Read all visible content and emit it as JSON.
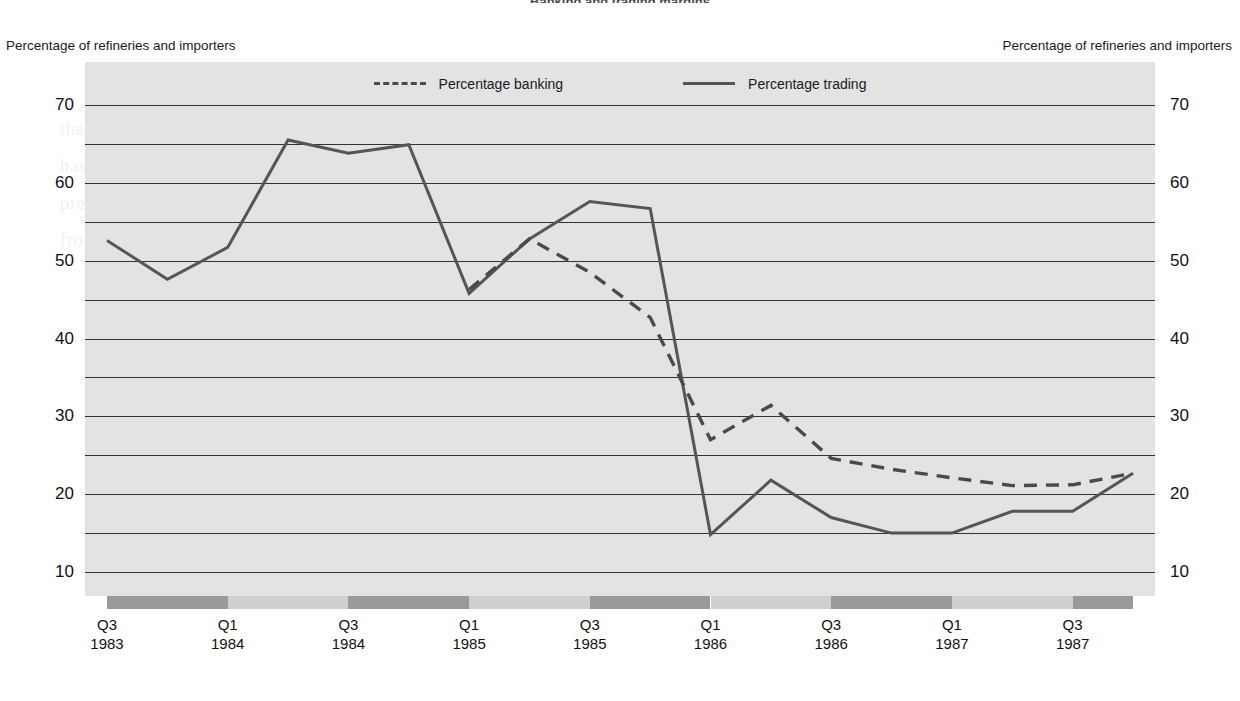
{
  "title_partial": "Banking and trading margins",
  "axis_caption_left": "Percentage of refineries and importers",
  "axis_caption_right": "Percentage of refineries and importers",
  "colors": {
    "plot_background": "#e3e3e3",
    "gridline": "#333333",
    "trading_line": "#555555",
    "banking_line": "#4a4a4a",
    "band_dark": "#9a9a9a",
    "band_light": "#cfcfcf"
  },
  "legend": {
    "position": "top-center",
    "items": [
      {
        "label": "Percentage banking",
        "style": "dashed",
        "name": "legend-banking"
      },
      {
        "label": "Percentage trading",
        "style": "solid",
        "name": "legend-trading"
      }
    ]
  },
  "yticks": [
    "70",
    "60",
    "50",
    "40",
    "30",
    "20",
    "10"
  ],
  "xlabels": [
    {
      "q": "Q3",
      "year": "1983"
    },
    {
      "q": "Q1",
      "year": "1984"
    },
    {
      "q": "Q3",
      "year": "1984"
    },
    {
      "q": "Q1",
      "year": "1985"
    },
    {
      "q": "Q3",
      "year": "1985"
    },
    {
      "q": "Q1",
      "year": "1986"
    },
    {
      "q": "Q3",
      "year": "1986"
    },
    {
      "q": "Q1",
      "year": "1987"
    },
    {
      "q": "Q3",
      "year": "1987"
    }
  ],
  "bleed_text": "the market which had been the scene of so much activity in the preceding period. It is clear that the number of participants in the market has declined sharply since the middle of 1985, and that the remaining traders account for a much larger share of total turnover than was previously the case. The figures below show this trend, with the proportion of refineries and importers reporting trading activity falling from about sixty-five per cent to under twenty per cent over a period of some eighteen months.",
  "chart_data": {
    "type": "line",
    "title": "Banking and trading margins",
    "xlabel": "",
    "ylabel": "Percentage of refineries and importers",
    "ylim": [
      10,
      70
    ],
    "yticks": [
      10,
      15,
      20,
      25,
      30,
      35,
      40,
      45,
      50,
      55,
      60,
      65,
      70
    ],
    "ytick_labels_shown": [
      10,
      20,
      30,
      40,
      50,
      60,
      70
    ],
    "grid": true,
    "grid_interval": 5,
    "legend_position": "top-center",
    "x": [
      "Q3 1983",
      "Q4 1983",
      "Q1 1984",
      "Q2 1984",
      "Q3 1984",
      "Q4 1984",
      "Q1 1985",
      "Q2 1985",
      "Q3 1985",
      "Q4 1985",
      "Q1 1986",
      "Q2 1986",
      "Q3 1986",
      "Q4 1986",
      "Q1 1987",
      "Q2 1987",
      "Q3 1987",
      "Q4 1987"
    ],
    "x_tick_labels": [
      "Q3 1983",
      "Q1 1984",
      "Q3 1984",
      "Q1 1985",
      "Q3 1985",
      "Q1 1986",
      "Q3 1986",
      "Q1 1987",
      "Q3 1987"
    ],
    "series": [
      {
        "name": "Percentage trading",
        "style": "solid",
        "color": "#555555",
        "values": [
          52.6,
          47.6,
          51.7,
          65.5,
          63.8,
          64.9,
          45.8,
          52.8,
          57.6,
          56.7,
          14.8,
          21.8,
          17.0,
          15.0,
          15.0,
          17.8,
          17.8,
          22.7
        ]
      },
      {
        "name": "Percentage banking",
        "style": "dashed",
        "color": "#4a4a4a",
        "values": [
          null,
          null,
          null,
          null,
          null,
          null,
          46.3,
          52.8,
          48.5,
          42.7,
          27.0,
          31.4,
          24.6,
          23.2,
          22.1,
          21.1,
          21.2,
          22.7
        ]
      }
    ]
  },
  "band_strip": [
    {
      "shade": "dark",
      "from": 0,
      "to": 2
    },
    {
      "shade": "light",
      "from": 2,
      "to": 4
    },
    {
      "shade": "dark",
      "from": 4,
      "to": 6
    },
    {
      "shade": "light",
      "from": 6,
      "to": 8
    },
    {
      "shade": "dark",
      "from": 8,
      "to": 10
    },
    {
      "shade": "light",
      "from": 10,
      "to": 12
    },
    {
      "shade": "dark",
      "from": 12,
      "to": 14
    },
    {
      "shade": "light",
      "from": 14,
      "to": 16
    },
    {
      "shade": "dark",
      "from": 16,
      "to": 17
    }
  ]
}
